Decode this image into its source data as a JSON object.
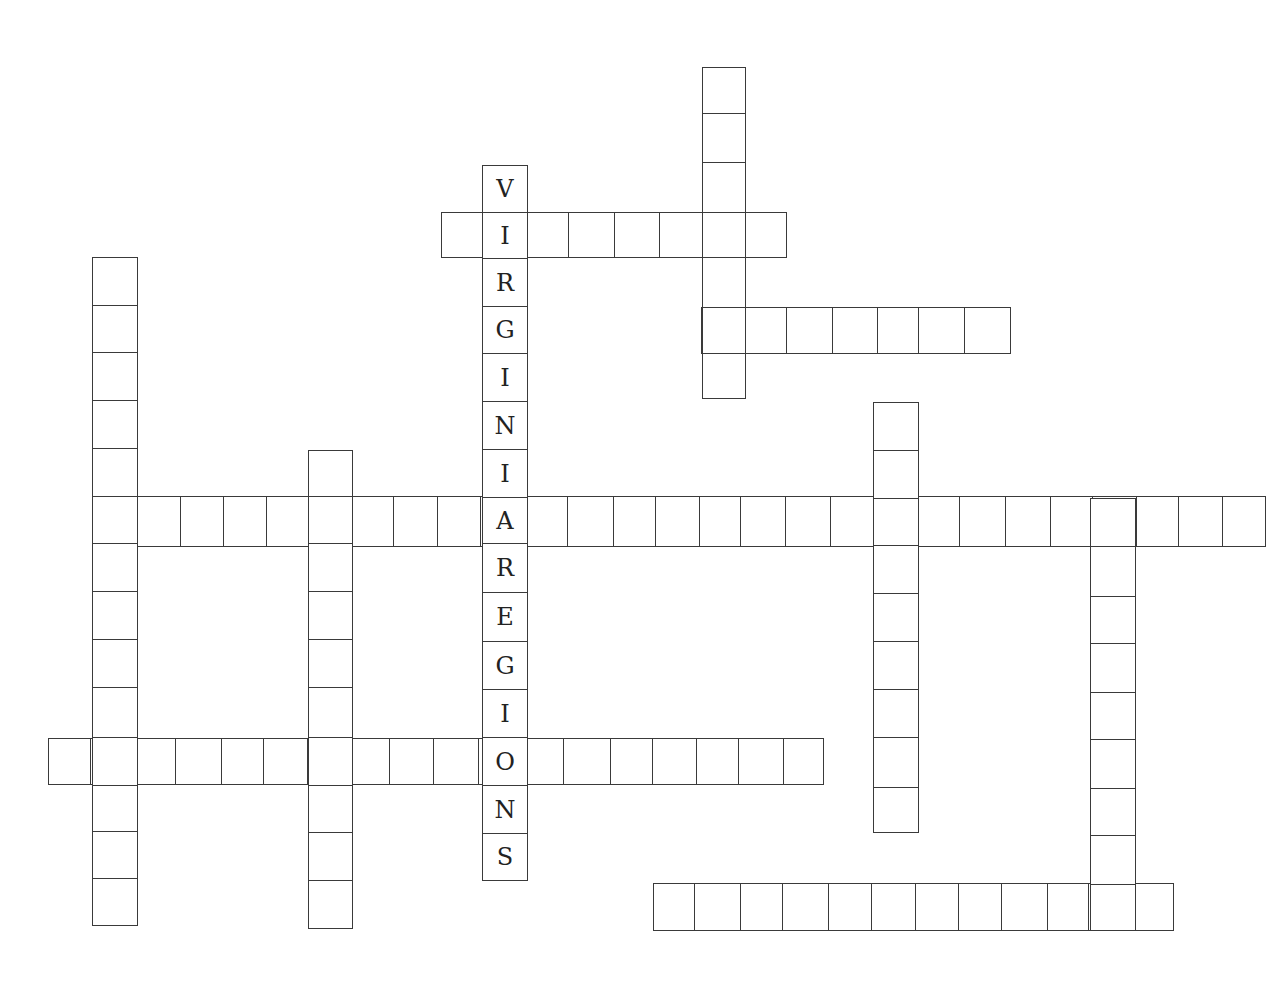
{
  "puzzle": {
    "type": "crossword",
    "colors": {
      "line": "#3a3a3a",
      "letter": "#222222",
      "background": "#ffffff"
    },
    "words": [
      {
        "id": "down-virginia-regions",
        "direction": "down",
        "x": 482,
        "y0": 165,
        "w": 45,
        "rows": [
          165,
          212,
          258,
          306,
          353,
          401,
          449,
          497,
          543,
          592,
          641,
          689,
          737,
          785,
          833,
          880
        ],
        "letters": [
          "V",
          "I",
          "R",
          "G",
          "I",
          "N",
          "I",
          "A",
          "R",
          "E",
          "G",
          "I",
          "O",
          "N",
          "S"
        ]
      },
      {
        "id": "across-top",
        "direction": "across",
        "y": 212,
        "h": 45,
        "cols": [
          441,
          484,
          527,
          568,
          614,
          659,
          703,
          745,
          786
        ],
        "letters": []
      },
      {
        "id": "down-top-right",
        "direction": "down",
        "x": 702,
        "w": 43,
        "rows": [
          67,
          113,
          162,
          212,
          257,
          307,
          353,
          398
        ],
        "letters": []
      },
      {
        "id": "across-upper-right",
        "direction": "across",
        "y": 307,
        "h": 46,
        "cols": [
          701,
          745,
          786,
          832,
          877,
          918,
          964,
          1010
        ],
        "letters": []
      },
      {
        "id": "down-left",
        "direction": "down",
        "x": 92,
        "w": 45,
        "rows": [
          257,
          305,
          352,
          400,
          448,
          496,
          543,
          591,
          639,
          687,
          737,
          785,
          831,
          878,
          925
        ],
        "letters": []
      },
      {
        "id": "down-left-2",
        "direction": "down",
        "x": 308,
        "w": 44,
        "rows": [
          450,
          496,
          543,
          591,
          639,
          687,
          737,
          785,
          832,
          880,
          928
        ],
        "letters": []
      },
      {
        "id": "across-long",
        "direction": "across",
        "y": 496,
        "h": 50,
        "cols": [
          92,
          136,
          180,
          223,
          266,
          309,
          352,
          393,
          437,
          480,
          525,
          567,
          613,
          655,
          699,
          740,
          785,
          830,
          873,
          918,
          959,
          1005,
          1050,
          1092,
          1136,
          1178,
          1222,
          1265
        ],
        "letters": []
      },
      {
        "id": "down-right-mid",
        "direction": "down",
        "x": 873,
        "w": 45,
        "rows": [
          402,
          450,
          498,
          545,
          593,
          641,
          689,
          737,
          787,
          832
        ],
        "letters": []
      },
      {
        "id": "down-right",
        "direction": "down",
        "x": 1090,
        "w": 45,
        "rows": [
          498,
          546,
          596,
          643,
          692,
          739,
          788,
          835,
          884,
          930
        ],
        "letters": []
      },
      {
        "id": "across-lower-left",
        "direction": "across",
        "y": 738,
        "h": 46,
        "cols": [
          48,
          90,
          134,
          175,
          221,
          263,
          307,
          350,
          389,
          433,
          478,
          522,
          563,
          610,
          652,
          696,
          738,
          783,
          823
        ],
        "letters": []
      },
      {
        "id": "across-bottom",
        "direction": "across",
        "y": 883,
        "h": 47,
        "cols": [
          653,
          694,
          740,
          782,
          828,
          871,
          915,
          958,
          1001,
          1047,
          1088,
          1132,
          1173
        ],
        "letters": []
      }
    ]
  }
}
